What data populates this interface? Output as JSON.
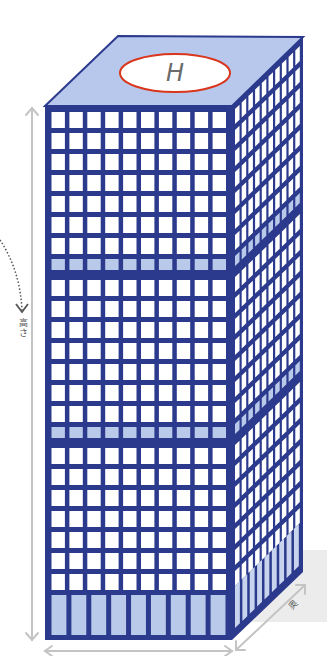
{
  "colors": {
    "frame": "#2b3a8c",
    "window": "#ffffff",
    "band": "#b9c9ea",
    "roof": "#b7c8ec",
    "side_shade": "#c8d4ee",
    "helipad_fill": "#ffffff",
    "helipad_stroke": "#d9361c",
    "helipad_letter": "#6b6b6b",
    "arrow": "#c4c4c4",
    "shadow": "#ececec",
    "dotted": "#555555"
  },
  "building": {
    "front": {
      "x": 45,
      "y": 106,
      "w": 187,
      "h": 534
    },
    "roof": {
      "points": "45,106 118,36 303,37 232,106"
    },
    "side": {
      "points": "232,106 303,37 303,572 232,640"
    },
    "grid": {
      "columns": 10,
      "row_pitch": 21,
      "first_row_y": 112,
      "rows": [
        "w",
        "w",
        "w",
        "w",
        "w",
        "w",
        "w",
        "b",
        "w",
        "w",
        "w",
        "w",
        "w",
        "w",
        "w",
        "b",
        "w",
        "w",
        "w",
        "w",
        "w",
        "w",
        "w"
      ],
      "base": {
        "panels": 9,
        "y": 595,
        "h": 40
      }
    },
    "side_columns": 10
  },
  "helipad": {
    "cx": 175,
    "cy": 73,
    "rx": 55,
    "ry": 19,
    "letter": "H"
  },
  "labels": {
    "height": "高さ",
    "depth": "奥"
  },
  "arrows": {
    "height": {
      "x": 32,
      "y1": 108,
      "y2": 640
    },
    "width": {
      "y": 651,
      "x1": 45,
      "x2": 232
    },
    "depth": {
      "x1": 236,
      "y1": 650,
      "x2": 305,
      "y2": 585
    }
  }
}
